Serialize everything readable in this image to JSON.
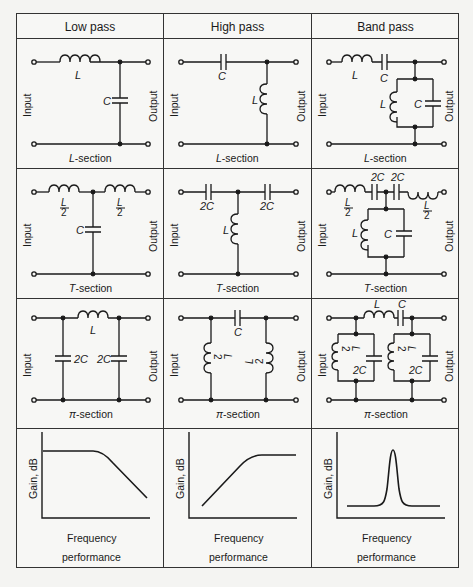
{
  "table": {
    "columns": [
      {
        "header": "Low pass"
      },
      {
        "header": "High pass"
      },
      {
        "header": "Band pass"
      }
    ],
    "rows": [
      {
        "section_label_prefix": "L",
        "section_label_suffix": "-section",
        "cells": [
          {
            "input_label": "Input",
            "output_label": "Output",
            "components": [
              "L",
              "C"
            ]
          },
          {
            "input_label": "Input",
            "output_label": "Output",
            "components": [
              "C",
              "L"
            ]
          },
          {
            "input_label": "Input",
            "output_label": "Output",
            "components": [
              "L",
              "C",
              "L",
              "C"
            ]
          }
        ]
      },
      {
        "section_label_prefix": "T",
        "section_label_suffix": "-section",
        "cells": [
          {
            "input_label": "Input",
            "output_label": "Output",
            "components": [
              "L/2",
              "C",
              "L/2"
            ]
          },
          {
            "input_label": "Input",
            "output_label": "Output",
            "components": [
              "2C",
              "L",
              "2C"
            ]
          },
          {
            "input_label": "Input",
            "output_label": "Output",
            "components": [
              "L/2",
              "2C",
              "2C",
              "L/2",
              "L",
              "C"
            ]
          }
        ]
      },
      {
        "section_label_prefix": "π",
        "section_label_suffix": "-section",
        "cells": [
          {
            "input_label": "Input",
            "output_label": "Output",
            "components": [
              "2C",
              "L",
              "2C"
            ]
          },
          {
            "input_label": "Input",
            "output_label": "Output",
            "components": [
              "L/2",
              "C",
              "L/2"
            ]
          },
          {
            "input_label": "Input",
            "output_label": "Output",
            "components": [
              "L",
              "C",
              "L/2",
              "2C",
              "L/2",
              "2C"
            ]
          }
        ]
      }
    ],
    "response_row": {
      "y_label": "Gain, dB",
      "x_label": "Frequency",
      "caption": "performance",
      "curves": [
        "low-pass-rolloff",
        "high-pass-rise",
        "band-pass-peak"
      ]
    }
  },
  "labels": {
    "L": "L",
    "C": "C",
    "twoC": "2C",
    "half_num": "L",
    "half_den": "2",
    "input": "Input",
    "output": "Output"
  }
}
